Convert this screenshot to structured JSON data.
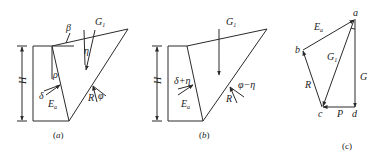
{
  "panels": {
    "a": {
      "caption": {
        "open": "(",
        "letter": "a",
        "close": ")"
      },
      "labels": {
        "beta": "β",
        "G": "G",
        "G_sub": "1",
        "eta": "η",
        "rho": "ρ",
        "delta": "δ",
        "E": "E",
        "E_sub": "a",
        "R": "R",
        "phi": "φ",
        "H": "H"
      }
    },
    "b": {
      "caption": {
        "open": "(",
        "letter": "b",
        "close": ")"
      },
      "labels": {
        "G": "G",
        "G_sub": "1",
        "delta_eta": "δ+η",
        "E": "E",
        "E_sub": "a",
        "R": "R",
        "phi_eta": "φ−η",
        "H": "H"
      }
    },
    "c": {
      "caption": "(c)",
      "labels": {
        "a": "a",
        "b": "b",
        "c": "c",
        "d": "d",
        "E": "E",
        "E_sub": "a",
        "G1": "G",
        "G1_sub": "1",
        "G": "G",
        "R": "R",
        "P": "P"
      }
    }
  }
}
